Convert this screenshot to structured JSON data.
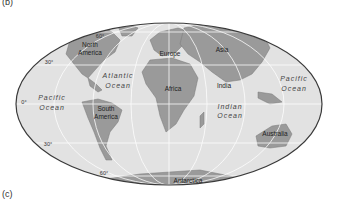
{
  "panel_labels": {
    "top": "(b)",
    "bottom": "(c)"
  },
  "continents": {
    "north_america": [
      "North",
      "America"
    ],
    "south_america": [
      "South",
      "America"
    ],
    "europe": "Europe",
    "asia": "Asia",
    "africa": "Africa",
    "india": "India",
    "australia": "Australia",
    "antarctica": "Antarctica"
  },
  "oceans": {
    "atlantic": [
      "Atlantic",
      "Ocean"
    ],
    "pacific_west": [
      "Pacific",
      "Ocean"
    ],
    "pacific_east": [
      "Pacific",
      "Ocean"
    ],
    "indian": [
      "Indian",
      "Ocean"
    ]
  },
  "latitudes": {
    "n60": "60°",
    "n30": "30°",
    "eq": "0°",
    "s30": "30°",
    "s60": "60°"
  },
  "colors": {
    "ocean": "#e2e2e2",
    "land": "#9a9a9a",
    "grid": "#ffffff",
    "outline": "#3a3a3a"
  }
}
